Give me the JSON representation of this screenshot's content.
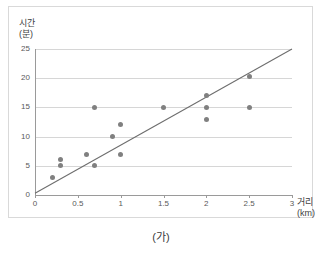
{
  "caption": "(가)",
  "chart_data": {
    "type": "scatter",
    "title": "",
    "xlabel": "거리",
    "xlabel_unit": "(km)",
    "ylabel": "시간",
    "ylabel_unit": "(분)",
    "xlim": [
      0,
      3
    ],
    "ylim": [
      0,
      25
    ],
    "xticks": [
      "0",
      "0.5",
      "1",
      "1.5",
      "2",
      "2.5",
      "3"
    ],
    "xtick_values": [
      0,
      0.5,
      1,
      1.5,
      2,
      2.5,
      3
    ],
    "yticks": [
      "0",
      "5",
      "10",
      "15",
      "20",
      "25"
    ],
    "ytick_values": [
      0,
      5,
      10,
      15,
      20,
      25
    ],
    "grid": "horizontal",
    "legend": "none",
    "marker_color": "#808080",
    "line_color": "#6e6e6e",
    "gridline_color": "#d6d6d6",
    "axis_color": "#9a9a9a",
    "points": [
      {
        "x": 0.2,
        "y": 3
      },
      {
        "x": 0.3,
        "y": 5
      },
      {
        "x": 0.3,
        "y": 6
      },
      {
        "x": 0.6,
        "y": 7
      },
      {
        "x": 0.7,
        "y": 5
      },
      {
        "x": 0.7,
        "y": 15
      },
      {
        "x": 0.9,
        "y": 10
      },
      {
        "x": 1.0,
        "y": 7
      },
      {
        "x": 1.0,
        "y": 12
      },
      {
        "x": 1.5,
        "y": 15
      },
      {
        "x": 2.0,
        "y": 13
      },
      {
        "x": 2.0,
        "y": 15
      },
      {
        "x": 2.0,
        "y": 17
      },
      {
        "x": 2.5,
        "y": 15
      },
      {
        "x": 2.5,
        "y": 20.3
      }
    ],
    "trendline": {
      "x0": 0,
      "y0": 0.3,
      "x1": 3,
      "y1": 25
    }
  }
}
